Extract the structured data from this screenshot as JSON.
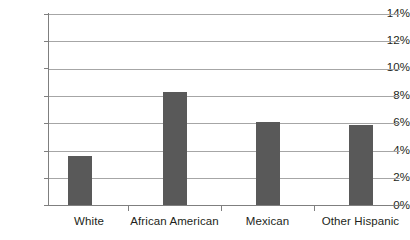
{
  "chart_data": {
    "type": "bar",
    "title": "",
    "subtitle": "",
    "xlabel": "",
    "ylabel": "",
    "categories": [
      "White",
      "African American",
      "Mexican",
      "Other Hispanic"
    ],
    "values": [
      3.6,
      8.3,
      6.1,
      5.9
    ],
    "series": [
      {
        "name": "",
        "values": [
          3.6,
          8.3,
          6.1,
          5.9
        ]
      }
    ],
    "ylim": [
      0,
      14
    ],
    "ytick_values": [
      0,
      2,
      4,
      6,
      8,
      10,
      12,
      14
    ],
    "ytick_labels": [
      "0%",
      "2%",
      "4%",
      "6%",
      "8%",
      "10%",
      "12%",
      "14%"
    ],
    "grid": true,
    "grid_axis": "y",
    "legend": false,
    "legend_position": "none",
    "annotations": [],
    "colors": {
      "bar": "#595959",
      "gridline": "#a6a6a6",
      "axis": "#7f7f7f",
      "text": "#231f20",
      "background": "#ffffff"
    }
  }
}
